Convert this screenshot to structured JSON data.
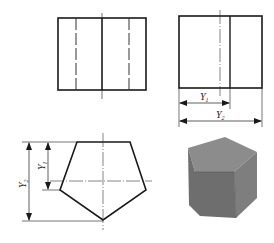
{
  "figure": {
    "views": {
      "front_view": {
        "label": "front-view"
      },
      "side_view": {
        "label": "left-side-view"
      },
      "top_view": {
        "label": "top-view-pentagon"
      },
      "model": {
        "label": "pentagonal-prism-3d"
      }
    },
    "dimensions": {
      "y1_main": "Y",
      "y1_sub": "1",
      "y2_main": "Y",
      "y2_sub": "2"
    },
    "colors": {
      "line": "#1a1a1a",
      "prism_top": "#8a8a8a",
      "prism_front": "#6f6f6f",
      "prism_side": "#7d7d7d"
    }
  }
}
